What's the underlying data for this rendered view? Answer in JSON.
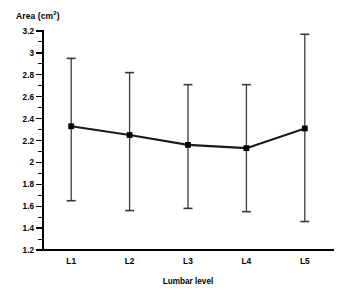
{
  "chart_data": {
    "type": "line",
    "title": "",
    "subtitle": "",
    "xlabel": "Lumbar level",
    "ylabel": "Area (cm2)",
    "ylabel_base": "Area (cm",
    "ylabel_sup": "2",
    "ylabel_close": ")",
    "categories": [
      "L1",
      "L2",
      "L3",
      "L4",
      "L5"
    ],
    "values": [
      2.33,
      2.25,
      2.16,
      2.13,
      2.31
    ],
    "error_upper": [
      2.95,
      2.82,
      2.71,
      2.71,
      3.17
    ],
    "error_lower": [
      1.65,
      1.56,
      1.58,
      1.55,
      1.46
    ],
    "series": [
      {
        "name": "Mean cross-sectional area",
        "values": [
          2.33,
          2.25,
          2.16,
          2.13,
          2.31
        ],
        "error_upper": [
          2.95,
          2.82,
          2.71,
          2.71,
          3.17
        ],
        "error_lower": [
          1.65,
          1.56,
          1.58,
          1.55,
          1.46
        ]
      }
    ],
    "ylim": [
      1.2,
      3.2
    ],
    "ytick_values": [
      3.2,
      3,
      2.8,
      2.6,
      2.4,
      2.2,
      2,
      1.8,
      1.6,
      1.4,
      1.2
    ],
    "ytick_labels": [
      "3.2",
      "3",
      "2.8",
      "2.6",
      "2.4",
      "2.2",
      "2",
      "1.8",
      "1.6",
      "1.4",
      "1.2"
    ],
    "ytick_step": 0.2,
    "grid": false,
    "legend": false,
    "legend_position": "none",
    "marker": "square",
    "errorbar_style": "capped",
    "colors": {
      "line": "#1a1a1a",
      "marker": "#000000",
      "errorbar": "#3a3a3a",
      "axis": "#000000",
      "background": "#ffffff",
      "text": "#000000"
    }
  }
}
